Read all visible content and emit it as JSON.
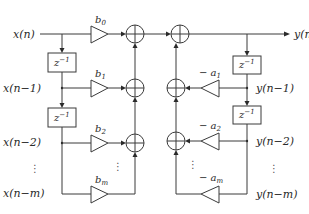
{
  "diagram": {
    "type": "IIR filter direct form I block diagram",
    "inputs": {
      "x0": "x(n)",
      "x1": "x(n−1)",
      "x2": "x(n−2)",
      "xm": "x(n−m)"
    },
    "outputs": {
      "y0": "y(n)",
      "y1": "y(n−1)",
      "y2": "y(n−2)",
      "ym": "y(n−m)"
    },
    "delay_label": "z",
    "delay_exp": "−1",
    "feedforward": [
      {
        "base": "b",
        "sub": "0"
      },
      {
        "base": "b",
        "sub": "1"
      },
      {
        "base": "b",
        "sub": "2"
      },
      {
        "base": "b",
        "sub": "m"
      }
    ],
    "feedback": [
      {
        "base": "− a",
        "sub": "1"
      },
      {
        "base": "− a",
        "sub": "2"
      },
      {
        "base": "− a",
        "sub": "m"
      }
    ],
    "ellipsis": "⋮"
  }
}
